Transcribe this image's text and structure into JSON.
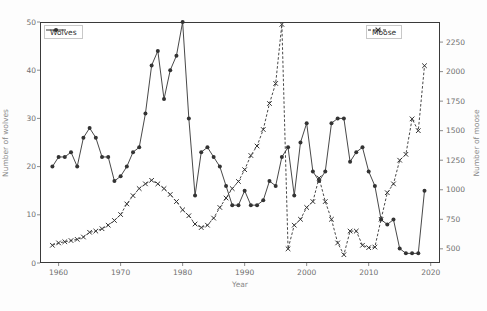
{
  "caption": {
    "cut_off_text": " "
  },
  "chart_data": {
    "type": "line",
    "title": "",
    "xlabel": "Year",
    "ylabel": "Number of wolves",
    "y2label": "Number of moose",
    "xlim": [
      1957.0,
      2021.5
    ],
    "ylim": [
      0,
      50
    ],
    "y2lim": [
      380,
      2420
    ],
    "grid": false,
    "xticks": [
      1960,
      1970,
      1980,
      1990,
      2000,
      2010,
      2020
    ],
    "xticklabels": [
      "1960",
      "1970",
      "1980",
      "1990",
      "2000",
      "2010",
      "2020"
    ],
    "yticks": [
      0,
      10,
      20,
      30,
      40,
      50
    ],
    "yticklabels": [
      "0",
      "10",
      "20",
      "30",
      "40",
      "50"
    ],
    "y2ticks": [
      500,
      750,
      1000,
      1250,
      1500,
      1750,
      2000,
      2250
    ],
    "y2ticklabels": [
      "500",
      "750",
      "1000",
      "1250",
      "1500",
      "1750",
      "2000",
      "2250"
    ],
    "legend_position": "top-left and top-right",
    "series": [
      {
        "name": "Wolves",
        "axis": "left",
        "color": "#333333",
        "linestyle": "solid",
        "marker": "circle",
        "x": [
          1959,
          1960,
          1961,
          1962,
          1963,
          1964,
          1965,
          1966,
          1967,
          1968,
          1969,
          1970,
          1971,
          1972,
          1973,
          1974,
          1975,
          1976,
          1977,
          1978,
          1979,
          1980,
          1981,
          1982,
          1983,
          1984,
          1985,
          1986,
          1987,
          1988,
          1989,
          1990,
          1991,
          1992,
          1993,
          1994,
          1995,
          1996,
          1997,
          1998,
          1999,
          2000,
          2001,
          2002,
          2003,
          2004,
          2005,
          2006,
          2007,
          2008,
          2009,
          2010,
          2011,
          2012,
          2013,
          2014,
          2015,
          2016,
          2017,
          2018,
          2019
        ],
        "values": [
          20,
          22,
          22,
          23,
          20,
          26,
          28,
          26,
          22,
          22,
          17,
          18,
          20,
          23,
          24,
          31,
          41,
          44,
          34,
          40,
          43,
          50,
          30,
          14,
          23,
          24,
          22,
          20,
          16,
          12,
          12,
          15,
          12,
          12,
          13,
          17,
          16,
          22,
          24,
          14,
          25,
          29,
          19,
          17,
          19,
          29,
          30,
          30,
          21,
          23,
          24,
          19,
          16,
          9,
          8,
          9,
          3,
          2,
          2,
          2,
          15
        ]
      },
      {
        "name": "Moose",
        "axis": "right",
        "color": "#333333",
        "linestyle": "dashed",
        "marker": "x",
        "x": [
          1959,
          1960,
          1961,
          1962,
          1963,
          1964,
          1965,
          1966,
          1967,
          1968,
          1969,
          1970,
          1971,
          1972,
          1973,
          1974,
          1975,
          1976,
          1977,
          1978,
          1979,
          1980,
          1981,
          1982,
          1983,
          1984,
          1985,
          1986,
          1987,
          1988,
          1989,
          1990,
          1991,
          1992,
          1993,
          1994,
          1995,
          1996,
          1997,
          1998,
          1999,
          2000,
          2001,
          2002,
          2003,
          2004,
          2005,
          2006,
          2007,
          2008,
          2009,
          2010,
          2011,
          2012,
          2013,
          2014,
          2015,
          2016,
          2017,
          2018,
          2019
        ],
        "values": [
          530,
          550,
          560,
          570,
          580,
          600,
          640,
          650,
          670,
          700,
          740,
          790,
          880,
          950,
          1010,
          1050,
          1080,
          1050,
          1010,
          960,
          900,
          830,
          780,
          710,
          680,
          700,
          760,
          850,
          930,
          1010,
          1070,
          1170,
          1290,
          1370,
          1510,
          1730,
          1900,
          2400,
          500,
          700,
          750,
          850,
          900,
          1100,
          900,
          750,
          550,
          450,
          650,
          650,
          530,
          510,
          515,
          750,
          975,
          1050,
          1250,
          1300,
          1600,
          1500,
          2050
        ]
      }
    ]
  },
  "legends": [
    {
      "label": "Wolves",
      "marker": "circle-marker-icon",
      "style": "solid"
    },
    {
      "label": "Moose",
      "marker": "x-marker-icon",
      "style": "dashed"
    }
  ]
}
